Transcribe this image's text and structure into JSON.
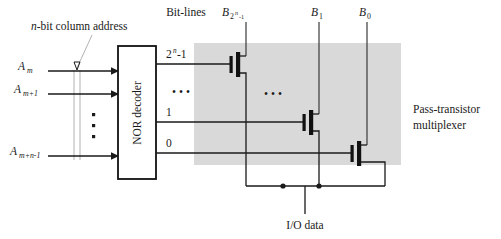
{
  "figure": {
    "type": "circuit-schematic",
    "annotations": {
      "column_address": "n-bit column address",
      "bit_lines": "Bit-lines",
      "decoder": "NOR decoder",
      "multiplexer_line1": "Pass-transistor",
      "multiplexer_line2": "multiplexer",
      "io_data": "I/O data"
    },
    "address_inputs": [
      {
        "id": "addr-0",
        "base": "A",
        "sub": "m"
      },
      {
        "id": "addr-1",
        "base": "A",
        "sub": "m+1"
      },
      {
        "id": "addr-2",
        "base": "A",
        "sub": "m+n-1"
      }
    ],
    "address_vertical_ellipsis": "⋮",
    "decoder_outputs": [
      {
        "id": "out-top",
        "base": "2",
        "sup": "n",
        "suffix": "-1"
      },
      {
        "id": "out-one",
        "label": "1"
      },
      {
        "id": "out-zero",
        "label": "0"
      }
    ],
    "decoder_output_ellipsis": "• • •",
    "bitline_ellipsis": "• • •",
    "bit_line_labels": [
      {
        "id": "bitline-msb",
        "base": "B",
        "sub": "2",
        "subsup": "n",
        "subsuffix": "-1"
      },
      {
        "id": "bitline-1",
        "base": "B",
        "sub": "1"
      },
      {
        "id": "bitline-0",
        "base": "B",
        "sub": "0"
      }
    ],
    "colors": {
      "shade": "#d9d9d9",
      "ink": "#1a1a1a",
      "leader": "#a8a8a8",
      "page": "#ffffff"
    }
  }
}
